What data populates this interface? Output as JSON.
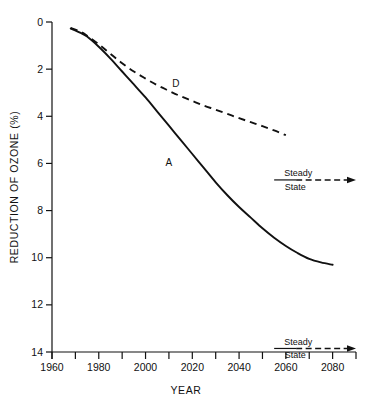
{
  "chart_data": {
    "type": "line",
    "title": "",
    "xlabel": "YEAR",
    "ylabel": "REDUCTION OF OZONE (%)",
    "xlim": [
      1960,
      2090
    ],
    "ylim": [
      0,
      14
    ],
    "y_axis_inverted": true,
    "grid": false,
    "legend": "inline-curve-labels",
    "x_ticks_major": [
      1960,
      1980,
      2000,
      2020,
      2040,
      2060,
      2080
    ],
    "x_ticks_minor": [
      1970,
      1990,
      2010,
      2030,
      2050,
      2070
    ],
    "x_tick_labels": [
      "1960",
      "1980",
      "2000",
      "2020",
      "2040",
      "2060",
      "2080"
    ],
    "y_ticks": [
      0,
      2,
      4,
      6,
      8,
      10,
      12,
      14
    ],
    "y_tick_labels": [
      "0",
      "2",
      "4",
      "6",
      "8",
      "10",
      "12",
      "14"
    ],
    "series": [
      {
        "name": "A",
        "label": "A",
        "style": "solid",
        "label_x": 2010,
        "label_y": 6.1,
        "x": [
          1968,
          1972,
          1975,
          1980,
          1985,
          1990,
          1995,
          2000,
          2005,
          2010,
          2015,
          2020,
          2025,
          2030,
          2035,
          2040,
          2045,
          2050,
          2055,
          2060,
          2065,
          2070,
          2075,
          2080
        ],
        "y": [
          0.28,
          0.45,
          0.62,
          1.05,
          1.55,
          2.1,
          2.65,
          3.2,
          3.8,
          4.4,
          5.0,
          5.6,
          6.2,
          6.8,
          7.35,
          7.85,
          8.3,
          8.75,
          9.15,
          9.5,
          9.8,
          10.05,
          10.2,
          10.3
        ]
      },
      {
        "name": "D",
        "label": "D",
        "style": "dashed",
        "label_x": 2013,
        "label_y": 2.75,
        "x": [
          1968,
          1972,
          1975,
          1980,
          1985,
          1990,
          1995,
          2000,
          2005,
          2010,
          2015,
          2020,
          2025,
          2030,
          2035,
          2040,
          2045,
          2050,
          2055,
          2060
        ],
        "y": [
          0.25,
          0.4,
          0.58,
          0.95,
          1.35,
          1.75,
          2.1,
          2.4,
          2.68,
          2.92,
          3.15,
          3.35,
          3.55,
          3.72,
          3.9,
          4.08,
          4.25,
          4.42,
          4.6,
          4.8
        ]
      }
    ],
    "annotations": [
      {
        "name": "steady-state-upper",
        "line1": "Steady",
        "line2": "State",
        "x_start": 2055,
        "x_end": 2090,
        "y": 6.7
      },
      {
        "name": "steady-state-lower",
        "line1": "Steady",
        "line2": "State",
        "x_start": 2055,
        "x_end": 2090,
        "y": 13.85
      }
    ]
  }
}
